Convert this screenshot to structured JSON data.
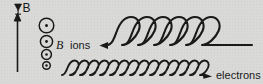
{
  "figure": {
    "background_color": "#d9d9d7",
    "ink_color": "#1a1a1a",
    "labels": {
      "gradient_b": "B",
      "gradient_symbol": "∇⊥",
      "field_label": "B",
      "ions": "ions",
      "electrons": "electrons"
    },
    "axis_arrow": {
      "name": "gradient-direction-arrow",
      "direction": "up",
      "meaning": "direction of increasing B"
    },
    "field_symbols": {
      "name": "magnetic-field-out-of-page",
      "glyph": "circled-dot",
      "count": 4,
      "radii": [
        7.5,
        6.2,
        5.0,
        3.8
      ],
      "note": "circle size decreases downward indicating weaker B"
    },
    "ion_track": {
      "name": "ion-trochoid",
      "loops": 6,
      "drift_direction": "left",
      "loop_orientation": "up",
      "arrow": "left-arrowhead"
    },
    "electron_track": {
      "name": "electron-trochoid",
      "loops": 14,
      "drift_direction": "right",
      "loop_orientation": "up",
      "arrow": "right-arrowhead"
    }
  }
}
